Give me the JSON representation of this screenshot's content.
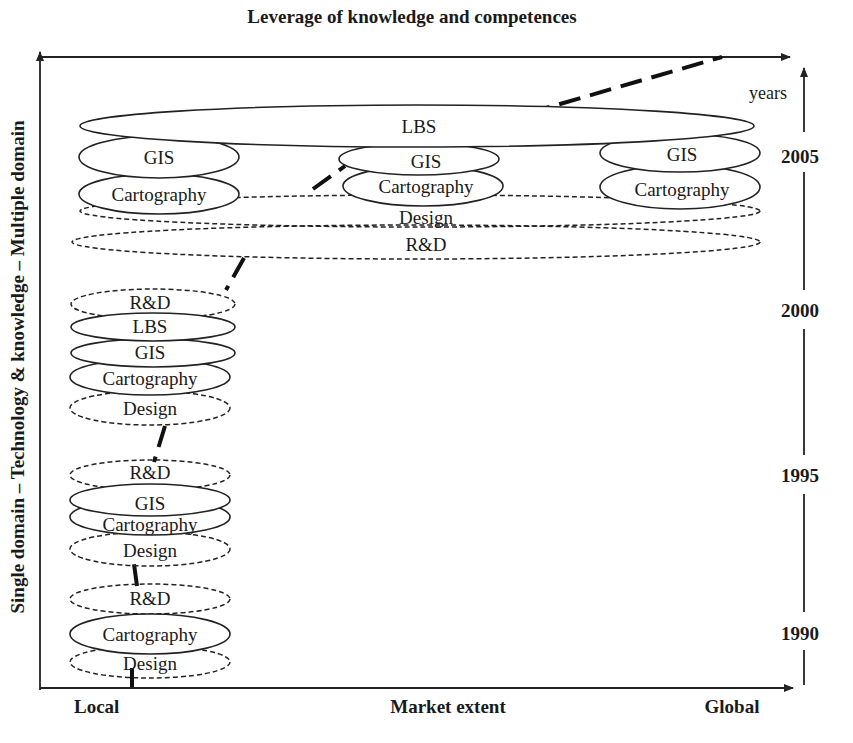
{
  "diagram": {
    "top_axis_label": "Leverage of knowledge and competences",
    "left_axis_label": "Single domain – Technology & knowledge – Multiple domain",
    "bottom_axis": {
      "left": "Local",
      "center": "Market extent",
      "right": "Global"
    },
    "time_axis": {
      "unit": "years",
      "ticks": [
        "2005",
        "2000",
        "1995",
        "1990"
      ]
    },
    "stages": [
      {
        "year": "1990",
        "items": [
          {
            "label": "R&D",
            "style": "dashed"
          },
          {
            "label": "Cartography",
            "style": "solid"
          },
          {
            "label": "Design",
            "style": "dashed"
          }
        ]
      },
      {
        "year": "1995",
        "items": [
          {
            "label": "R&D",
            "style": "dashed"
          },
          {
            "label": "GIS",
            "style": "solid"
          },
          {
            "label": "Cartography",
            "style": "solid"
          },
          {
            "label": "Design",
            "style": "dashed"
          }
        ]
      },
      {
        "year": "2000",
        "items": [
          {
            "label": "R&D",
            "style": "dashed"
          },
          {
            "label": "LBS",
            "style": "solid"
          },
          {
            "label": "GIS",
            "style": "solid"
          },
          {
            "label": "Cartography",
            "style": "solid"
          },
          {
            "label": "Design",
            "style": "dashed"
          }
        ]
      },
      {
        "year": "2005",
        "items": [
          {
            "label": "LBS",
            "style": "solid",
            "span": "global"
          },
          {
            "label": "GIS",
            "style": "solid",
            "position": "local"
          },
          {
            "label": "Cartography",
            "style": "solid",
            "position": "local"
          },
          {
            "label": "GIS",
            "style": "solid",
            "position": "middle"
          },
          {
            "label": "Cartography",
            "style": "solid",
            "position": "middle"
          },
          {
            "label": "GIS",
            "style": "solid",
            "position": "global"
          },
          {
            "label": "Cartography",
            "style": "solid",
            "position": "global"
          },
          {
            "label": "Design",
            "style": "dashed",
            "span": "global"
          },
          {
            "label": "R&D",
            "style": "dashed",
            "span": "global"
          }
        ]
      }
    ]
  }
}
